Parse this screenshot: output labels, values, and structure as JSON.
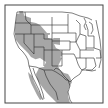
{
  "map": {
    "title": "Species range map",
    "region": "Western North America (United States and Mexico)",
    "legend": {
      "range_label": "Distribution range"
    },
    "colors": {
      "background": "#ffffff",
      "range_fill": "#a6a6a6",
      "boundary_stroke": "#2a2a2a",
      "frame_stroke": "#444444",
      "water": "#ffffff"
    }
  }
}
